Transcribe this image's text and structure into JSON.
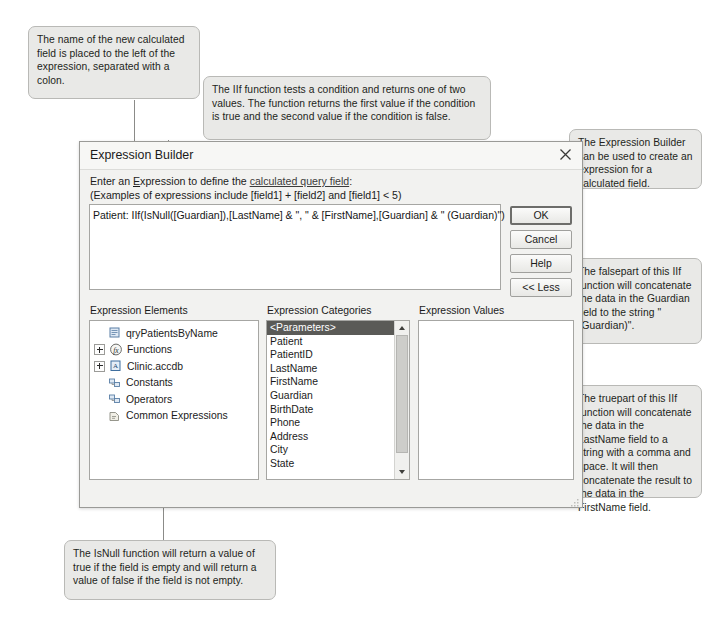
{
  "callouts": {
    "name_field": "The name of the new calculated field is placed to the left of the expression, separated with a colon.",
    "iif_function": "The IIf function tests a condition and returns one of two values. The function returns the first value if the condition is true and the second value if the condition is false.",
    "expression_builder": "The Expression Builder can be used to create an expression for a calculated field.",
    "falsepart": "The falsepart of this IIf function will concatenate the data in the Guardian field to the string \" (Guardian)\".",
    "truepart": "The truepart of this IIf function will concatenate the data in the LastName field to a string with a comma and space. It will then concatenate the result to the data in the FirstName field.",
    "isnull": "The IsNull function will return a value of true if the field is empty and will return a value of false if the field is not empty."
  },
  "dialog": {
    "title": "Expression Builder",
    "close_icon": "close-icon",
    "instruction_prefix": "Enter an ",
    "instruction_e": "E",
    "instruction_mid": "xpression to define the ",
    "instruction_link": "calculated query field",
    "instruction_suffix": ":",
    "examples": "(Examples of expressions include [field1] + [field2] and [field1] < 5)",
    "expression": "Patient: IIf(IsNull([Guardian]),[LastName] & \", \" & [FirstName],[Guardian] & \" (Guardian)\")",
    "buttons": {
      "ok": "OK",
      "cancel": "Cancel",
      "help": "Help",
      "less": "<< Less"
    },
    "columns": {
      "elements": "Expression Elements",
      "categories": "Expression Categories",
      "values": "Expression Values"
    },
    "elements_tree": [
      {
        "label": "qryPatientsByName",
        "icon": "query-icon",
        "expandable": false
      },
      {
        "label": "Functions",
        "icon": "function-icon",
        "expandable": true
      },
      {
        "label": "Clinic.accdb",
        "icon": "database-icon",
        "expandable": true
      },
      {
        "label": "Constants",
        "icon": "constants-icon",
        "expandable": false
      },
      {
        "label": "Operators",
        "icon": "operators-icon",
        "expandable": false
      },
      {
        "label": "Common Expressions",
        "icon": "common-expressions-icon",
        "expandable": false
      }
    ],
    "categories": [
      {
        "label": "<Parameters>",
        "selected": true
      },
      {
        "label": "Patient",
        "selected": false
      },
      {
        "label": "PatientID",
        "selected": false
      },
      {
        "label": "LastName",
        "selected": false
      },
      {
        "label": "FirstName",
        "selected": false
      },
      {
        "label": "Guardian",
        "selected": false
      },
      {
        "label": "BirthDate",
        "selected": false
      },
      {
        "label": "Phone",
        "selected": false
      },
      {
        "label": "Address",
        "selected": false
      },
      {
        "label": "City",
        "selected": false
      },
      {
        "label": "State",
        "selected": false
      }
    ],
    "values": []
  }
}
